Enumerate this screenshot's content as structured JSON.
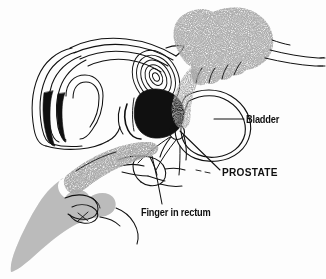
{
  "figure": {
    "background_color": "#fdfdfd",
    "ink_color": "#101010",
    "stipple_color": "#6a6a6a",
    "labels": [
      {
        "id": "bladder",
        "text": "Bladder",
        "style": "mixed-case"
      },
      {
        "id": "prostate",
        "text": "PROSTATE",
        "style": "upper-case"
      },
      {
        "id": "finger",
        "text": "Finger in rectum",
        "style": "mixed-case"
      }
    ],
    "structures": [
      "gloved-examining-hand-upper",
      "gloved-examining-hand-lower",
      "extended-index-finger",
      "bladder-outline",
      "prostate-gland",
      "rectum-filled",
      "sacrum-coccyx-contours",
      "penis-urethra-contours",
      "pubic-bone",
      "forearm-sleeve-lines"
    ],
    "leaders": [
      {
        "from": "bladder-label",
        "to": "bladder-outline"
      },
      {
        "from": "prostate-label",
        "to": "prostate-gland"
      },
      {
        "from": "finger-label",
        "to": "extended-index-finger"
      }
    ]
  }
}
